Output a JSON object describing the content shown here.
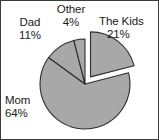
{
  "chart_data": {
    "type": "pie",
    "title": "",
    "subtitle": "",
    "xlabel": "",
    "ylabel": "",
    "legend_position": "none",
    "grid": false,
    "labels_on_slices": false,
    "start_angle_deg": 0,
    "direction": "clockwise",
    "exploded_slice": "The Kids",
    "fill_color": "#a8a8a8",
    "stroke_color": "#2e2e2e",
    "background_color": "#ffffff",
    "categories": [
      "The Kids",
      "Mom",
      "Dad",
      "Other"
    ],
    "values": [
      21,
      64,
      11,
      4
    ],
    "value_unit": "%",
    "slices": [
      {
        "name": "The Kids",
        "label": "The Kids",
        "value": 21,
        "percent_text": "21%",
        "color": "#a8a8a8",
        "exploded": true
      },
      {
        "name": "Mom",
        "label": "Mom",
        "value": 64,
        "percent_text": "64%",
        "color": "#a8a8a8",
        "exploded": false
      },
      {
        "name": "Dad",
        "label": "Dad",
        "value": 11,
        "percent_text": "11%",
        "color": "#a8a8a8",
        "exploded": false
      },
      {
        "name": "Other",
        "label": "Other",
        "value": 4,
        "percent_text": "4%",
        "color": "#a8a8a8",
        "exploded": false
      }
    ]
  },
  "labels": {
    "the_kids": {
      "name": "The Kids",
      "percent": "21%"
    },
    "mom": {
      "name": "Mom",
      "percent": "64%"
    },
    "dad": {
      "name": "Dad",
      "percent": "11%"
    },
    "other": {
      "name": "Other",
      "percent": "4%"
    }
  }
}
